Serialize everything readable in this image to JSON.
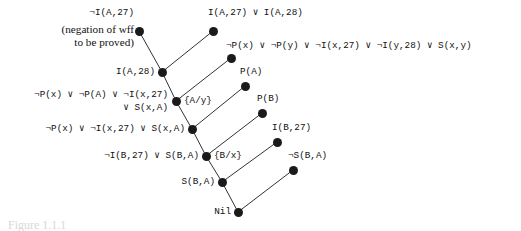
{
  "figure": {
    "caption": "Figure 1.1.1",
    "annotation": "(negation of wff\nto be proved)"
  },
  "nodes": [
    {
      "id": "n1",
      "label": "¬I(A,27)",
      "x": 139,
      "y": 31,
      "label_x": 134,
      "label_y": 13,
      "align": "right"
    },
    {
      "id": "n2",
      "label": "I(A,27) ∨ I(A,28)",
      "x": 213,
      "y": 31,
      "label_x": 208,
      "label_y": 13,
      "align": "left"
    },
    {
      "id": "n3",
      "label": "I(A,28)",
      "x": 162,
      "y": 72,
      "label_x": 155,
      "label_y": 72,
      "align": "right"
    },
    {
      "id": "n4",
      "label": "¬P(x) ∨ ¬P(y) ∨ ¬I(x,27) ∨ ¬I(y,28) ∨ S(x,y)",
      "x": 231,
      "y": 58,
      "label_x": 226,
      "label_y": 46,
      "align": "left"
    },
    {
      "id": "n5",
      "label": "¬P(x) ∨ ¬P(A) ∨ ¬I(x,27)\n       ∨ S(x,A)",
      "x": 176,
      "y": 101,
      "label_x": 168,
      "label_y": 101,
      "align": "right"
    },
    {
      "id": "n6",
      "label": "P(A)",
      "x": 245,
      "y": 86,
      "label_x": 240,
      "label_y": 72,
      "align": "left"
    },
    {
      "id": "n7",
      "label": "¬P(x) ∨ ¬I(x,27) ∨ S(x,A)",
      "x": 192,
      "y": 129,
      "label_x": 185,
      "label_y": 129,
      "align": "right"
    },
    {
      "id": "n8",
      "label": "P(B)",
      "x": 262,
      "y": 113,
      "label_x": 257,
      "label_y": 99,
      "align": "left"
    },
    {
      "id": "n9",
      "label": "¬I(B,27) ∨ S(B,A)",
      "x": 206,
      "y": 156,
      "label_x": 199,
      "label_y": 156,
      "align": "right"
    },
    {
      "id": "n10",
      "label": "I(B,27)",
      "x": 277,
      "y": 142,
      "label_x": 272,
      "label_y": 128,
      "align": "left"
    },
    {
      "id": "n11",
      "label": "S(B,A)",
      "x": 222,
      "y": 182,
      "label_x": 215,
      "label_y": 182,
      "align": "right"
    },
    {
      "id": "n12",
      "label": "¬S(B,A)",
      "x": 293,
      "y": 170,
      "label_x": 288,
      "label_y": 156,
      "align": "left"
    },
    {
      "id": "n13",
      "label": "Nil",
      "x": 238,
      "y": 212,
      "label_x": 231,
      "label_y": 212,
      "align": "right"
    }
  ],
  "substitutions": [
    {
      "id": "s1",
      "label": "{A/y}",
      "x": 184,
      "y": 101
    },
    {
      "id": "s2",
      "label": "{B/x}",
      "x": 214,
      "y": 156
    }
  ],
  "edges": [
    {
      "from": "n1",
      "to": "n3"
    },
    {
      "from": "n2",
      "to": "n3"
    },
    {
      "from": "n3",
      "to": "n5"
    },
    {
      "from": "n4",
      "to": "n5"
    },
    {
      "from": "n5",
      "to": "n7"
    },
    {
      "from": "n6",
      "to": "n7"
    },
    {
      "from": "n7",
      "to": "n9"
    },
    {
      "from": "n8",
      "to": "n9"
    },
    {
      "from": "n9",
      "to": "n11"
    },
    {
      "from": "n10",
      "to": "n11"
    },
    {
      "from": "n11",
      "to": "n13"
    },
    {
      "from": "n12",
      "to": "n13"
    }
  ],
  "annotation_pos": {
    "x": 134,
    "y": 23
  },
  "colors": {
    "node": "#1a1a1a",
    "edge": "#333333",
    "text": "#111111",
    "background": "#ffffff"
  }
}
